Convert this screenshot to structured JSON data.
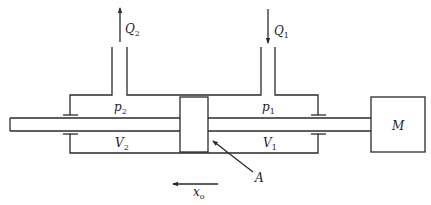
{
  "diagram": {
    "type": "hydraulic cylinder schematic",
    "labels": {
      "flow_out": {
        "base": "Q",
        "sub": "2"
      },
      "flow_in": {
        "base": "Q",
        "sub": "1"
      },
      "pressure_left": {
        "base": "p",
        "sub": "2"
      },
      "pressure_right": {
        "base": "p",
        "sub": "1"
      },
      "volume_left": {
        "base": "V",
        "sub": "2"
      },
      "volume_right": {
        "base": "V",
        "sub": "1"
      },
      "mass": "M",
      "piston_area": "A",
      "displacement": {
        "base": "x",
        "sub": "o"
      }
    },
    "arrows": {
      "flow_out_direction": "up",
      "flow_in_direction": "down",
      "displacement_direction": "left"
    },
    "colors": {
      "line": "#2a2a2a",
      "background": "#ffffff"
    }
  }
}
